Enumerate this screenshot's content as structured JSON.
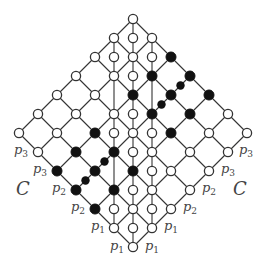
{
  "diagram": {
    "origin": {
      "x": 133,
      "y": 19
    },
    "step": 19,
    "rows": 12,
    "colors": {
      "line": "#333333",
      "node_fill_open": "#ffffff",
      "node_fill_filled": "#111111",
      "label": "#444444"
    },
    "vertical_lines": [
      {
        "c": 0,
        "r_from": 0,
        "r_to": 12
      },
      {
        "c": -1,
        "r_from": 1,
        "r_to": 11
      },
      {
        "c": 1,
        "r_from": 1,
        "r_to": 11
      }
    ],
    "filled_nodes": [
      [
        2,
        2
      ],
      [
        1,
        3
      ],
      [
        3,
        3
      ],
      [
        0,
        4
      ],
      [
        2,
        4
      ],
      [
        4,
        4
      ],
      [
        1,
        5
      ],
      [
        3,
        5
      ],
      [
        -2,
        6
      ],
      [
        2,
        6
      ],
      [
        -3,
        7
      ],
      [
        -1,
        7
      ],
      [
        -4,
        8
      ],
      [
        -2,
        8
      ],
      [
        0,
        8
      ],
      [
        -3,
        9
      ],
      [
        -1,
        9
      ],
      [
        -2,
        10
      ]
    ],
    "open_nodes": [
      [
        0,
        0
      ],
      [
        -1,
        1
      ],
      [
        0,
        1
      ],
      [
        1,
        1
      ],
      [
        -2,
        2
      ],
      [
        -1,
        2
      ],
      [
        0,
        2
      ],
      [
        1,
        2
      ],
      [
        -3,
        3
      ],
      [
        -1,
        3
      ],
      [
        0,
        3
      ],
      [
        -4,
        4
      ],
      [
        -2,
        4
      ],
      [
        -5,
        5
      ],
      [
        -3,
        5
      ],
      [
        -1,
        5
      ],
      [
        0,
        5
      ],
      [
        5,
        5
      ],
      [
        -6,
        6
      ],
      [
        -4,
        6
      ],
      [
        -1,
        6
      ],
      [
        0,
        6
      ],
      [
        1,
        6
      ],
      [
        4,
        6
      ],
      [
        6,
        6
      ],
      [
        -5,
        7
      ],
      [
        0,
        7
      ],
      [
        1,
        7
      ],
      [
        3,
        7
      ],
      [
        5,
        7
      ],
      [
        1,
        8
      ],
      [
        2,
        8
      ],
      [
        4,
        8
      ],
      [
        0,
        9
      ],
      [
        1,
        9
      ],
      [
        3,
        9
      ],
      [
        -1,
        10
      ],
      [
        0,
        10
      ],
      [
        1,
        10
      ],
      [
        2,
        10
      ],
      [
        -1,
        11
      ],
      [
        0,
        11
      ],
      [
        1,
        11
      ],
      [
        0,
        12
      ]
    ],
    "small_dots": [
      [
        2.5,
        3.5
      ],
      [
        1.5,
        4.5
      ],
      [
        -1.5,
        7.5
      ],
      [
        -2.5,
        8.5
      ]
    ],
    "labels": [
      {
        "text": "p",
        "sub": "3",
        "x": 14,
        "y": 154
      },
      {
        "text": "p",
        "sub": "3",
        "x": 33,
        "y": 173
      },
      {
        "text": "p",
        "sub": "2",
        "x": 52,
        "y": 192
      },
      {
        "text": "p",
        "sub": "2",
        "x": 71,
        "y": 211
      },
      {
        "text": "p",
        "sub": "1",
        "x": 91,
        "y": 230
      },
      {
        "text": "p",
        "sub": "1",
        "x": 110,
        "y": 250
      },
      {
        "text": "p",
        "sub": "1",
        "x": 145,
        "y": 250
      },
      {
        "text": "p",
        "sub": "1",
        "x": 164,
        "y": 230
      },
      {
        "text": "p",
        "sub": "2",
        "x": 183,
        "y": 211
      },
      {
        "text": "p",
        "sub": "2",
        "x": 202,
        "y": 192
      },
      {
        "text": "p",
        "sub": "3",
        "x": 221,
        "y": 173
      },
      {
        "text": "p",
        "sub": "3",
        "x": 239,
        "y": 154
      }
    ],
    "region_labels": [
      {
        "text": "C",
        "x": 16,
        "y": 195
      },
      {
        "text": "C",
        "x": 233,
        "y": 195
      }
    ]
  }
}
